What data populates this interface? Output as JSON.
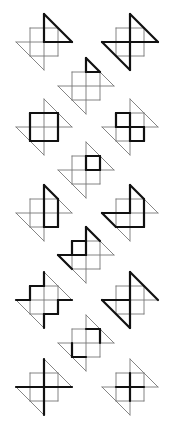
{
  "diagram": {
    "title": "",
    "cell_size": 14,
    "colors": {
      "thin_line": "#777777",
      "bold_line": "#111111",
      "background": "#ffffff"
    },
    "base_segments": [
      [
        [
          -1,
          -1
        ],
        [
          1,
          -1
        ]
      ],
      [
        [
          -1,
          1
        ],
        [
          1,
          1
        ]
      ],
      [
        [
          -1,
          -1
        ],
        [
          -1,
          1
        ]
      ],
      [
        [
          1,
          -1
        ],
        [
          1,
          1
        ]
      ],
      [
        [
          -2,
          0
        ],
        [
          2,
          0
        ]
      ],
      [
        [
          0,
          -2
        ],
        [
          0,
          2
        ]
      ],
      [
        [
          0,
          -2
        ],
        [
          2,
          0
        ]
      ],
      [
        [
          -2,
          0
        ],
        [
          0,
          2
        ]
      ]
    ],
    "figures": [
      {
        "id": 1,
        "center": [
          44,
          42
        ],
        "bold": [
          [
            [
              0,
              -2
            ],
            [
              0,
              0
            ]
          ],
          [
            [
              0,
              0
            ],
            [
              2,
              0
            ]
          ],
          [
            [
              0,
              -2
            ],
            [
              2,
              0
            ]
          ]
        ]
      },
      {
        "id": 2,
        "center": [
          130,
          42
        ],
        "bold": [
          [
            [
              0,
              -2
            ],
            [
              2,
              0
            ]
          ],
          [
            [
              -2,
              0
            ],
            [
              2,
              0
            ]
          ],
          [
            [
              0,
              -2
            ],
            [
              0,
              2
            ]
          ],
          [
            [
              -2,
              0
            ],
            [
              0,
              2
            ]
          ]
        ]
      },
      {
        "id": 3,
        "center": [
          86,
          86
        ],
        "bold": [
          [
            [
              0,
              -2
            ],
            [
              1,
              -1
            ]
          ],
          [
            [
              0,
              -1
            ],
            [
              1,
              -1
            ]
          ],
          [
            [
              0,
              -2
            ],
            [
              0,
              -1
            ]
          ]
        ]
      },
      {
        "id": 4,
        "center": [
          44,
          127
        ],
        "bold": [
          [
            [
              -1,
              -1
            ],
            [
              1,
              -1
            ]
          ],
          [
            [
              1,
              -1
            ],
            [
              1,
              1
            ]
          ],
          [
            [
              1,
              1
            ],
            [
              -1,
              1
            ]
          ],
          [
            [
              -1,
              1
            ],
            [
              -1,
              -1
            ]
          ]
        ]
      },
      {
        "id": 5,
        "center": [
          130,
          127
        ],
        "bold": [
          [
            [
              -1,
              -1
            ],
            [
              0,
              -1
            ]
          ],
          [
            [
              -1,
              -1
            ],
            [
              -1,
              0
            ]
          ],
          [
            [
              0,
              -1
            ],
            [
              0,
              1
            ]
          ],
          [
            [
              -1,
              0
            ],
            [
              1,
              0
            ]
          ],
          [
            [
              1,
              0
            ],
            [
              1,
              1
            ]
          ],
          [
            [
              0,
              1
            ],
            [
              1,
              1
            ]
          ]
        ]
      },
      {
        "id": 6,
        "center": [
          86,
          170
        ],
        "bold": [
          [
            [
              0,
              -1
            ],
            [
              1,
              -1
            ]
          ],
          [
            [
              1,
              -1
            ],
            [
              1,
              0
            ]
          ],
          [
            [
              1,
              0
            ],
            [
              0,
              0
            ]
          ],
          [
            [
              0,
              0
            ],
            [
              0,
              -1
            ]
          ]
        ]
      },
      {
        "id": 7,
        "center": [
          44,
          213
        ],
        "bold": [
          [
            [
              0,
              -2
            ],
            [
              1,
              -1
            ]
          ],
          [
            [
              1,
              -1
            ],
            [
              1,
              1
            ]
          ],
          [
            [
              1,
              1
            ],
            [
              0,
              1
            ]
          ],
          [
            [
              0,
              1
            ],
            [
              0,
              -2
            ]
          ]
        ]
      },
      {
        "id": 8,
        "center": [
          130,
          213
        ],
        "bold": [
          [
            [
              0,
              -2
            ],
            [
              0,
              0
            ]
          ],
          [
            [
              -2,
              0
            ],
            [
              0,
              0
            ]
          ],
          [
            [
              -2,
              0
            ],
            [
              -1,
              1
            ]
          ],
          [
            [
              -1,
              1
            ],
            [
              1,
              1
            ]
          ],
          [
            [
              1,
              1
            ],
            [
              1,
              -1
            ]
          ],
          [
            [
              1,
              -1
            ],
            [
              0,
              -2
            ]
          ]
        ]
      },
      {
        "id": 9,
        "center": [
          86,
          255
        ],
        "bold": [
          [
            [
              0,
              -2
            ],
            [
              1,
              -1
            ]
          ],
          [
            [
              -1,
              -1
            ],
            [
              0,
              -1
            ]
          ],
          [
            [
              -1,
              -1
            ],
            [
              -1,
              0
            ]
          ],
          [
            [
              0,
              -2
            ],
            [
              0,
              0
            ]
          ],
          [
            [
              -2,
              0
            ],
            [
              0,
              0
            ]
          ],
          [
            [
              -2,
              0
            ],
            [
              -1,
              1
            ]
          ]
        ]
      },
      {
        "id": 10,
        "center": [
          44,
          300
        ],
        "bold": [
          [
            [
              0,
              -2
            ],
            [
              0,
              -1
            ]
          ],
          [
            [
              0,
              -1
            ],
            [
              -1,
              -1
            ]
          ],
          [
            [
              -1,
              -1
            ],
            [
              -1,
              0
            ]
          ],
          [
            [
              -1,
              0
            ],
            [
              -2,
              0
            ]
          ],
          [
            [
              1,
              0
            ],
            [
              2,
              0
            ]
          ],
          [
            [
              1,
              0
            ],
            [
              1,
              1
            ]
          ],
          [
            [
              1,
              1
            ],
            [
              0,
              1
            ]
          ],
          [
            [
              0,
              1
            ],
            [
              0,
              2
            ]
          ]
        ]
      },
      {
        "id": 11,
        "center": [
          130,
          300
        ],
        "bold": [
          [
            [
              0,
              -2
            ],
            [
              2,
              0
            ]
          ],
          [
            [
              0,
              -2
            ],
            [
              0,
              0
            ]
          ],
          [
            [
              -2,
              0
            ],
            [
              0,
              0
            ]
          ],
          [
            [
              -2,
              0
            ],
            [
              0,
              2
            ]
          ],
          [
            [
              0,
              0
            ],
            [
              0,
              2
            ]
          ]
        ]
      },
      {
        "id": 12,
        "center": [
          86,
          343
        ],
        "bold": [
          [
            [
              0,
              -1
            ],
            [
              1,
              -1
            ]
          ],
          [
            [
              1,
              -1
            ],
            [
              1,
              0
            ]
          ],
          [
            [
              -1,
              0
            ],
            [
              -1,
              1
            ]
          ],
          [
            [
              -1,
              1
            ],
            [
              0,
              1
            ]
          ]
        ]
      },
      {
        "id": 13,
        "center": [
          44,
          387
        ],
        "bold": [
          [
            [
              0,
              -2
            ],
            [
              0,
              2
            ]
          ],
          [
            [
              -2,
              0
            ],
            [
              2,
              0
            ]
          ]
        ]
      },
      {
        "id": 14,
        "center": [
          130,
          387
        ],
        "bold": [
          [
            [
              -1,
              0
            ],
            [
              1,
              0
            ]
          ],
          [
            [
              0,
              -1
            ],
            [
              0,
              1
            ]
          ]
        ]
      }
    ]
  }
}
